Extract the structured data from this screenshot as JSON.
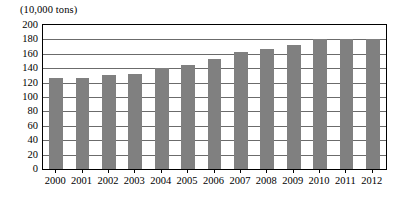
{
  "chart_data": {
    "type": "bar",
    "title": "(10,000 tons)",
    "subtitle": "",
    "xlabel": "",
    "ylabel": "",
    "unit_caption": "(10,000 tons)",
    "categories": [
      "2000",
      "2001",
      "2002",
      "2003",
      "2004",
      "2005",
      "2006",
      "2007",
      "2008",
      "2009",
      "2010",
      "2011",
      "2012"
    ],
    "values": [
      127,
      127,
      131,
      132,
      140,
      145,
      153,
      162,
      167,
      172,
      180,
      181,
      181
    ],
    "series": [
      {
        "name": "Output",
        "values": [
          127,
          127,
          131,
          132,
          140,
          145,
          153,
          162,
          167,
          172,
          180,
          181,
          181
        ]
      }
    ],
    "ylim": [
      0,
      200
    ],
    "xlim_categories": 13,
    "y_ticks": [
      0,
      20,
      40,
      60,
      80,
      100,
      120,
      140,
      160,
      180,
      200
    ],
    "y_tick_labels": [
      "0",
      "20",
      "40",
      "60",
      "80",
      "100",
      "120",
      "140",
      "160",
      "180",
      "200"
    ],
    "grid": true,
    "grid_axis": "y",
    "legend": false,
    "legend_position": "none",
    "bar_color": "#808080",
    "frame_color": "#000000",
    "gridline_color": "#6b6b6b",
    "background_color": "#ffffff",
    "annotations": []
  }
}
